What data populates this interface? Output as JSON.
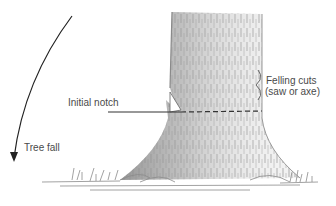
{
  "diagram": {
    "title": "",
    "labels": {
      "initial_notch": "Initial notch",
      "felling_cuts_line1": "Felling cuts",
      "felling_cuts_line2": "(saw or axe)",
      "tree_fall": "Tree fall"
    },
    "colors": {
      "trunk_shade": "#9a9a9a",
      "ink": "#333333",
      "text": "#4a4a4a"
    }
  }
}
